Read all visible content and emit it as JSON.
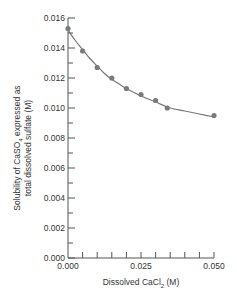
{
  "chart_data": {
    "type": "scatter",
    "title": "",
    "xlabel": "Dissolved CaCl",
    "xlabel_sub": "2",
    "xlabel_suffix": " (M)",
    "ylabel_line1_pre": "Solubility of CaSO",
    "ylabel_line1_sub": "4",
    "ylabel_line1_post": " expressed as",
    "ylabel_line2": "total dissolved sulfate (M)",
    "xlim": [
      0.0,
      0.05
    ],
    "ylim": [
      0.0,
      0.016
    ],
    "x_major_ticks": [
      0.0,
      0.025,
      0.05
    ],
    "x_tick_labels": [
      "0.000",
      "0.025",
      "0.050"
    ],
    "x_minor_step": 0.005,
    "y_major_ticks": [
      0.0,
      0.002,
      0.004,
      0.006,
      0.008,
      0.01,
      0.012,
      0.014,
      0.016
    ],
    "y_tick_labels": [
      "0.000",
      "0.002",
      "0.004",
      "0.006",
      "0.008",
      "0.010",
      "0.012",
      "0.014",
      "0.016"
    ],
    "y_minor_step": 0.001,
    "grid": false,
    "legend": "none",
    "series": [
      {
        "name": "measured",
        "marker": "circle",
        "color": "#7a7a7a",
        "x": [
          0.0,
          0.005,
          0.01,
          0.015,
          0.02,
          0.025,
          0.03,
          0.034,
          0.05
        ],
        "y": [
          0.0153,
          0.0138,
          0.0127,
          0.012,
          0.0113,
          0.0109,
          0.0105,
          0.01,
          0.0095
        ]
      },
      {
        "name": "fitted curve",
        "type": "line",
        "color": "#777777",
        "x": [
          0.0,
          0.0025,
          0.005,
          0.0075,
          0.01,
          0.0125,
          0.015,
          0.0175,
          0.02,
          0.025,
          0.03,
          0.035,
          0.04,
          0.045,
          0.05
        ],
        "y": [
          0.0152,
          0.0145,
          0.0139,
          0.0133,
          0.0128,
          0.0123,
          0.0119,
          0.0116,
          0.0113,
          0.0108,
          0.0104,
          0.01,
          0.0098,
          0.0096,
          0.0094
        ]
      }
    ]
  }
}
